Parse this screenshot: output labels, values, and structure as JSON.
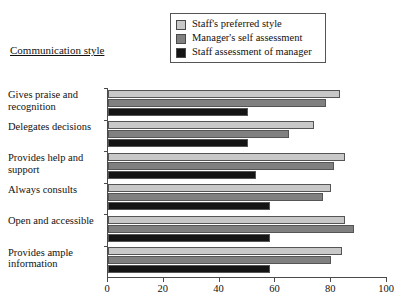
{
  "chart_data": {
    "type": "bar",
    "orientation": "horizontal",
    "title": "Communication style",
    "xlabel": "",
    "ylabel": "Communication style",
    "xlim": [
      0,
      100
    ],
    "xticks": [
      0,
      20,
      40,
      60,
      80,
      100
    ],
    "xtick_labels": [
      "0",
      "20",
      "40",
      "60",
      "80",
      "100"
    ],
    "grid": false,
    "legend_position": "top-center",
    "categories": [
      "Gives praise and recognition",
      "Delegates decisions",
      "Provides help and support",
      "Always consults",
      "Open and accessible",
      "Provides ample information"
    ],
    "series": [
      {
        "name": "Staff's preferred style",
        "color": "#c8c8c8",
        "values": [
          83,
          74,
          85,
          80,
          85,
          84
        ]
      },
      {
        "name": "Manager's self assessment",
        "color": "#808080",
        "values": [
          78,
          65,
          81,
          77,
          88,
          80
        ]
      },
      {
        "name": "Staff assessment of manager",
        "color": "#141414",
        "values": [
          50,
          50,
          53,
          58,
          58,
          58
        ]
      }
    ]
  },
  "legend": {
    "items": [
      {
        "label": "Staff's preferred style",
        "color": "#c8c8c8"
      },
      {
        "label": "Manager's self assessment",
        "color": "#808080"
      },
      {
        "label": "Staff assessment of manager",
        "color": "#141414"
      }
    ]
  },
  "axis": {
    "title": "Communication style"
  }
}
